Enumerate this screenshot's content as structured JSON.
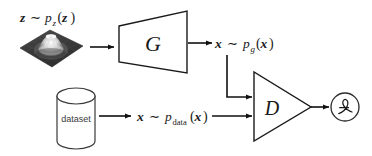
{
  "figure": {
    "background_color": "#ffffff",
    "stroke_color": "#1a1a1a"
  },
  "labels": {
    "noise_distribution": {
      "var": "z",
      "tilde": "∼",
      "p": "p",
      "sub": "z",
      "open": "(",
      "arg": "z",
      "close": ")",
      "full": "z ∼ p_z(z)"
    },
    "generated_distribution": {
      "var": "x",
      "tilde": "∼",
      "p": "p",
      "sub": "g",
      "open": "(",
      "arg": "x",
      "close": ")",
      "full": "x ∼ p_g(x)"
    },
    "data_distribution": {
      "var": "x",
      "tilde": "∼",
      "p": "p",
      "sub": "data",
      "open": "(",
      "arg": "x",
      "close": ")",
      "full": "x ∼ p_data(x)"
    },
    "generator": "G",
    "discriminator": "D",
    "dataset": "dataset",
    "loss": "ℒ"
  },
  "nodes": [
    {
      "id": "noise-plot",
      "kind": "image",
      "caption": "z ∼ p_z(z)",
      "description": "3D surface plot of a Gaussian density"
    },
    {
      "id": "generator",
      "kind": "trapezoid",
      "label": "G"
    },
    {
      "id": "dataset",
      "kind": "cylinder",
      "label": "dataset"
    },
    {
      "id": "discriminator",
      "kind": "triangle",
      "label": "D"
    },
    {
      "id": "loss",
      "kind": "circle",
      "label": "ℒ"
    }
  ],
  "edges": [
    {
      "from": "noise-plot",
      "to": "generator"
    },
    {
      "from": "generator",
      "to": "generated-distribution-label"
    },
    {
      "from": "generated-distribution-label",
      "to": "discriminator"
    },
    {
      "from": "dataset",
      "to": "data-distribution-label"
    },
    {
      "from": "data-distribution-label",
      "to": "discriminator"
    },
    {
      "from": "discriminator",
      "to": "loss"
    }
  ],
  "colors": {
    "stroke": "#1a1a1a",
    "cylinder_stroke": "#3a3a3a",
    "surface_dark": "#3b3b3b",
    "surface_light": "#f2f2f2",
    "text": "#1a1a1a"
  }
}
